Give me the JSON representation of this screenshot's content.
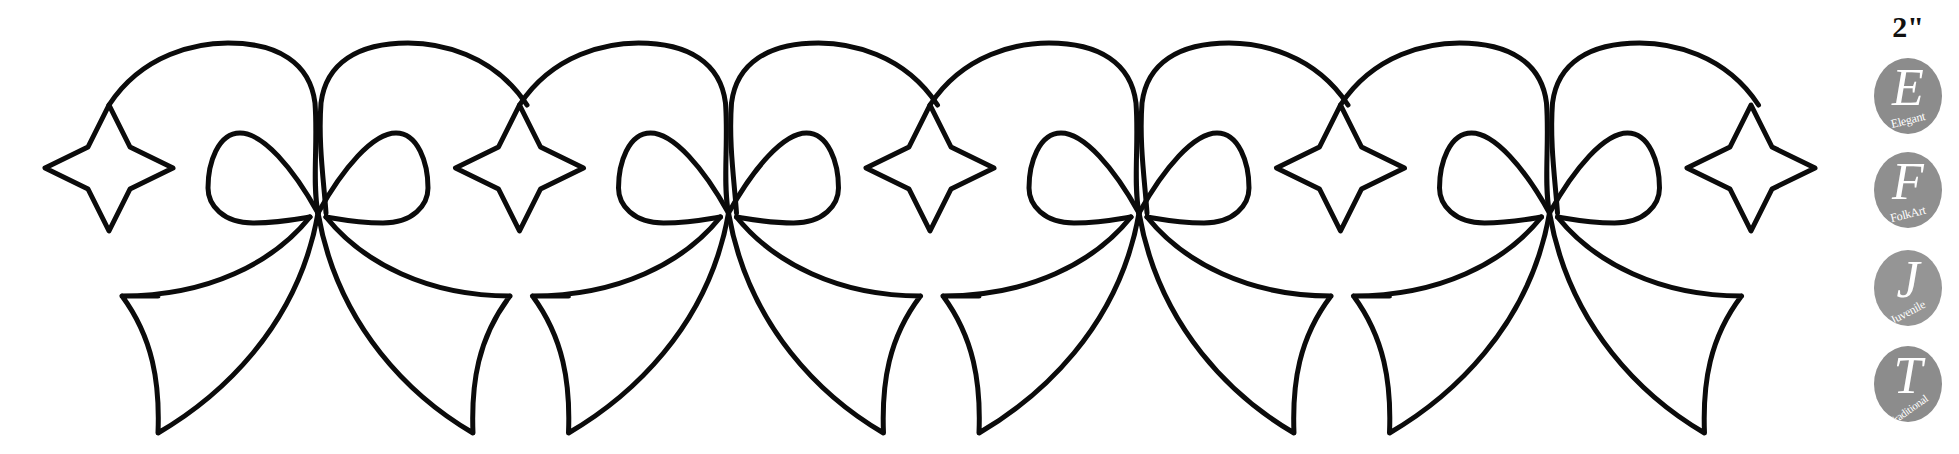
{
  "pattern": {
    "description": "Continuous quilting border stencil of bows with ribbon tails alternating with four-point stars",
    "stroke_color": "#0b0b0b",
    "background": "#ffffff",
    "bow_count": 4,
    "star_count": 5,
    "bow_centers_x": [
      318,
      728.5,
      1139,
      1549.5
    ],
    "star_centers_x": [
      109,
      519.5,
      930,
      1340.5,
      1751
    ]
  },
  "size_label": "2\"",
  "style_badges": [
    {
      "letter": "E",
      "label": "Elegant",
      "color": "#8a8a8a"
    },
    {
      "letter": "F",
      "label": "FolkArt",
      "color": "#8f8f8f"
    },
    {
      "letter": "J",
      "label": "Juvenile",
      "color": "#959595"
    },
    {
      "letter": "T",
      "label": "Traditional",
      "color": "#8c8c8c"
    }
  ]
}
